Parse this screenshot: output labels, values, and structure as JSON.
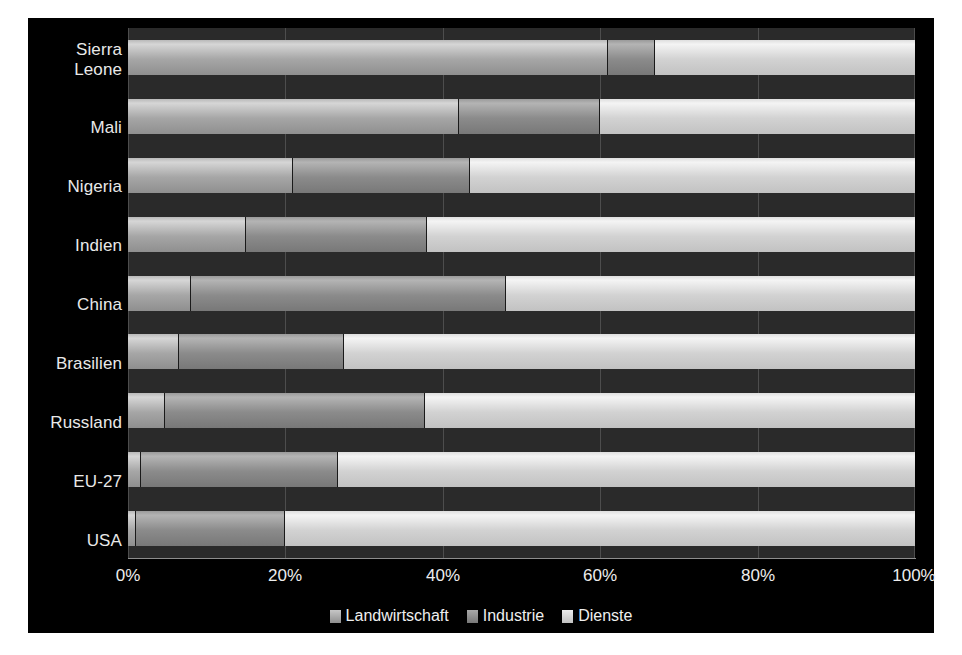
{
  "chart_data": {
    "type": "bar",
    "orientation": "horizontal",
    "stacked": true,
    "normalized_percent": true,
    "title": "",
    "subtitle": "",
    "xlabel": "",
    "ylabel": "",
    "xlim": [
      0,
      100
    ],
    "xtick_labels": [
      "0%",
      "20%",
      "40%",
      "60%",
      "80%",
      "100%"
    ],
    "xticks": [
      0,
      20,
      40,
      60,
      80,
      100
    ],
    "grid": true,
    "legend_position": "bottom",
    "categories": [
      "Sierra\nLeone",
      "Mali",
      "Nigeria",
      "Indien",
      "China",
      "Brasilien",
      "Russland",
      "EU-27",
      "USA"
    ],
    "series": [
      {
        "name": "Landwirtschaft",
        "color": "#a6a6a6",
        "values": [
          61,
          42,
          21,
          15,
          8,
          6.5,
          4.7,
          1.7,
          1
        ]
      },
      {
        "name": "Industrie",
        "color": "#8b8b8b",
        "values": [
          6,
          18,
          22.5,
          23,
          40,
          21,
          33,
          25,
          19
        ]
      },
      {
        "name": "Dienste",
        "color": "#d2d2d2",
        "values": [
          33,
          40,
          56.5,
          62,
          52,
          72.5,
          62.3,
          73.3,
          80
        ]
      }
    ]
  },
  "legend": {
    "items": [
      {
        "label": "Landwirtschaft",
        "swatch": "legend-swatch-agriculture"
      },
      {
        "label": "Industrie",
        "swatch": "legend-swatch-industry"
      },
      {
        "label": "Dienste",
        "swatch": "legend-swatch-services"
      }
    ]
  },
  "colors": {
    "background": "#000000",
    "plot_background": "#2a2a2a",
    "gridline": "#4d4d4d",
    "text": "#ededed"
  }
}
